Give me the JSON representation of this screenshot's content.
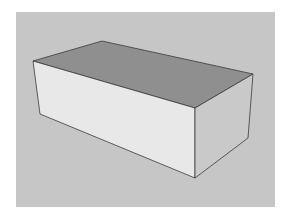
{
  "viewport": {
    "background": "#c6c6c6",
    "page_background": "#ffffff"
  },
  "model": {
    "object": "box",
    "faces": {
      "top": {
        "color": "#8f8f8f"
      },
      "front": {
        "color": "#e8e8e8"
      },
      "right": {
        "color": "#c9c9c9"
      }
    },
    "edge_color": "#3a3a3a",
    "vertices": {
      "top_left": [
        33,
        61
      ],
      "top_back": [
        102,
        41
      ],
      "top_right": [
        253,
        74
      ],
      "top_front": [
        195,
        108
      ],
      "bottom_left": [
        40,
        114
      ],
      "bottom_front": [
        195,
        178
      ],
      "bottom_right": [
        248,
        138
      ]
    }
  }
}
